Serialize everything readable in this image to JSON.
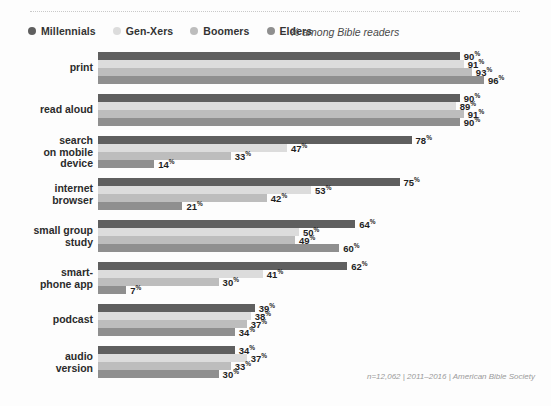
{
  "legend": {
    "items": [
      {
        "label": "Millennials",
        "color": "#5f5f5f"
      },
      {
        "label": "Gen-Xers",
        "color": "#dcdcdc"
      },
      {
        "label": "Boomers",
        "color": "#bdbdbd"
      },
      {
        "label": "Elders",
        "color": "#8f8f8f"
      }
    ],
    "note": "% among Bible readers"
  },
  "footnote": "n=12,062 | 2011–2016 | American Bible Society",
  "chart_data": {
    "type": "bar",
    "orientation": "horizontal",
    "title": "",
    "subtitle": "% among Bible readers",
    "xlabel": "",
    "ylabel": "",
    "xlim": [
      0,
      100
    ],
    "grid": false,
    "legend_position": "top-left",
    "value_suffix": "%",
    "categories": [
      "print",
      "read aloud",
      "search\non mobile\ndevice",
      "internet\nbrowser",
      "small group\nstudy",
      "smart-\nphone app",
      "podcast",
      "audio\nversion"
    ],
    "series": [
      {
        "name": "Millennials",
        "color": "#5f5f5f",
        "values": [
          90,
          90,
          78,
          75,
          64,
          62,
          39,
          34
        ]
      },
      {
        "name": "Gen-Xers",
        "color": "#dcdcdc",
        "values": [
          91,
          89,
          47,
          53,
          50,
          41,
          38,
          37
        ]
      },
      {
        "name": "Boomers",
        "color": "#bdbdbd",
        "values": [
          93,
          91,
          33,
          42,
          49,
          30,
          37,
          33
        ]
      },
      {
        "name": "Elders",
        "color": "#8f8f8f",
        "values": [
          96,
          90,
          14,
          21,
          60,
          7,
          34,
          30
        ]
      }
    ]
  }
}
